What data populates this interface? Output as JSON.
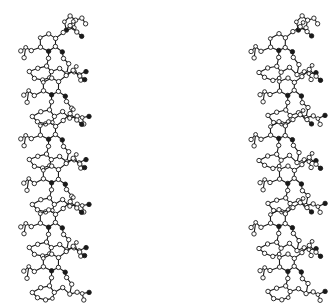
{
  "figure": {
    "kind": "stereo-pair molecular ball-and-stick diagram",
    "background": "#ffffff",
    "ink": "#1a1a1a",
    "views": [
      {
        "name": "left-view",
        "x_offset": 0,
        "mirror_shift": 0
      },
      {
        "name": "right-view",
        "x_offset": 232,
        "mirror_shift": 4
      }
    ],
    "chain": {
      "start_y": 20,
      "unit_height": 44,
      "units": 6,
      "column_x": 40
    },
    "unit_template": {
      "atoms": [
        [
          0,
          0
        ],
        [
          8,
          -4
        ],
        [
          16,
          0
        ],
        [
          16,
          9
        ],
        [
          8,
          13
        ],
        [
          0,
          9
        ],
        [
          -8,
          13
        ],
        [
          -14,
          9
        ],
        [
          -20,
          13
        ],
        [
          -16,
          20
        ],
        [
          24,
          -6
        ],
        [
          30,
          -12
        ],
        [
          36,
          -6
        ],
        [
          42,
          -2
        ],
        [
          34,
          -16
        ],
        [
          8,
          20
        ],
        [
          6,
          28
        ],
        [
          12,
          34
        ],
        [
          20,
          30
        ],
        [
          26,
          36
        ],
        [
          34,
          34
        ],
        [
          40,
          36
        ],
        [
          46,
          34
        ],
        [
          40,
          42
        ],
        [
          -2,
          30
        ],
        [
          -10,
          34
        ],
        [
          -6,
          40
        ],
        [
          2,
          42
        ],
        [
          10,
          40
        ],
        [
          24,
          20
        ],
        [
          28,
          26
        ],
        [
          22,
          14
        ]
      ],
      "bonds": [
        [
          0,
          1
        ],
        [
          1,
          2
        ],
        [
          2,
          3
        ],
        [
          3,
          4
        ],
        [
          4,
          5
        ],
        [
          5,
          0
        ],
        [
          5,
          6
        ],
        [
          6,
          7
        ],
        [
          7,
          8
        ],
        [
          7,
          9
        ],
        [
          2,
          10
        ],
        [
          10,
          11
        ],
        [
          11,
          12
        ],
        [
          12,
          13
        ],
        [
          11,
          14
        ],
        [
          4,
          15
        ],
        [
          15,
          16
        ],
        [
          16,
          17
        ],
        [
          17,
          18
        ],
        [
          18,
          19
        ],
        [
          19,
          20
        ],
        [
          20,
          21
        ],
        [
          21,
          22
        ],
        [
          21,
          23
        ],
        [
          16,
          24
        ],
        [
          24,
          25
        ],
        [
          25,
          26
        ],
        [
          26,
          27
        ],
        [
          27,
          28
        ],
        [
          28,
          17
        ],
        [
          3,
          31
        ],
        [
          31,
          29
        ],
        [
          29,
          30
        ],
        [
          30,
          19
        ]
      ]
    },
    "top_cap": {
      "atoms": [
        [
          24,
          2
        ],
        [
          30,
          -4
        ],
        [
          36,
          0
        ],
        [
          34,
          8
        ],
        [
          26,
          10
        ],
        [
          42,
          -2
        ],
        [
          46,
          4
        ]
      ],
      "bonds": [
        [
          0,
          1
        ],
        [
          1,
          2
        ],
        [
          2,
          3
        ],
        [
          3,
          4
        ],
        [
          4,
          0
        ],
        [
          2,
          5
        ],
        [
          5,
          6
        ]
      ]
    }
  }
}
